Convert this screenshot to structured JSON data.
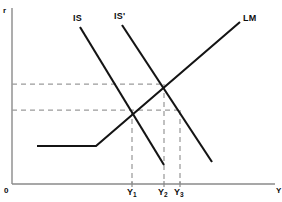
{
  "figure": {
    "kind": "is-lm-diagram",
    "width": 282,
    "height": 202,
    "background_color": "#ffffff"
  },
  "axes": {
    "y_axis_label": "r",
    "x_axis_label": "Y",
    "origin_label": "0",
    "axis_color": "#8a8a8a",
    "x_axis_y_px": 184,
    "y_axis_x_px": 12,
    "x_axis_end_px": 275,
    "y_axis_top_px": 8
  },
  "curves": [
    {
      "id": "is",
      "label": "IS",
      "color": "#141414",
      "label_x": 73,
      "label_y": 14,
      "points": [
        [
          80,
          27
        ],
        [
          164,
          165
        ]
      ]
    },
    {
      "id": "is-prime",
      "label": "IS'",
      "color": "#141414",
      "label_x": 114,
      "label_y": 12,
      "points": [
        [
          122,
          25
        ],
        [
          212,
          162
        ]
      ]
    },
    {
      "id": "lm",
      "label": "LM",
      "color": "#141414",
      "label_x": 243,
      "label_y": 14,
      "points": [
        [
          37,
          146
        ],
        [
          96,
          146
        ],
        [
          240,
          22
        ]
      ]
    }
  ],
  "guides": {
    "color": "#9b9b9b",
    "horizontal": [
      {
        "id": "r2-guide",
        "y": 84,
        "x_from": 12,
        "x_to": 164
      },
      {
        "id": "r1-guide",
        "y": 110,
        "x_from": 12,
        "x_to": 180
      }
    ],
    "vertical": [
      {
        "id": "y1-guide",
        "x": 132,
        "y_from": 110,
        "y_to": 184
      },
      {
        "id": "y2-guide",
        "x": 164,
        "y_from": 84,
        "y_to": 184
      },
      {
        "id": "y3-guide",
        "x": 180,
        "y_from": 110,
        "y_to": 184
      }
    ]
  },
  "equilibria": [
    {
      "id": "eq-1",
      "curves": "IS x LM",
      "x": 132,
      "y": 110
    },
    {
      "id": "eq-2",
      "curves": "IS' x LM",
      "x": 164,
      "y": 84
    },
    {
      "id": "eq-3",
      "curves": "IS' at r1",
      "x": 180,
      "y": 110
    }
  ],
  "x_ticks": [
    {
      "id": "y1",
      "base": "Y",
      "sub": "1",
      "x": 132,
      "label_x": 128,
      "label_y": 188
    },
    {
      "id": "y2",
      "base": "Y",
      "sub": "2",
      "x": 164,
      "label_x": 159,
      "label_y": 188
    },
    {
      "id": "y3",
      "base": "Y",
      "sub": "3",
      "x": 180,
      "label_x": 175,
      "label_y": 188
    }
  ],
  "chart_data": {
    "type": "line",
    "title": "",
    "xlabel": "Y",
    "ylabel": "r",
    "grid": false,
    "legend": "inline-curve-labels",
    "xlim": [
      0,
      282
    ],
    "ylim": [
      0,
      202
    ],
    "series": [
      {
        "name": "IS",
        "x": [
          80,
          164
        ],
        "y_pixels": [
          27,
          165
        ],
        "description": "downward-sloping goods-market schedule"
      },
      {
        "name": "IS'",
        "x": [
          122,
          212
        ],
        "y_pixels": [
          25,
          162
        ],
        "description": "rightward-shifted goods-market schedule"
      },
      {
        "name": "LM",
        "x": [
          37,
          96,
          240
        ],
        "y_pixels": [
          146,
          146,
          22
        ],
        "description": "money-market schedule with horizontal liquidity-trap segment then upward slope"
      }
    ],
    "annotations": [
      {
        "text": "IS",
        "x": 73,
        "y": 14
      },
      {
        "text": "IS'",
        "x": 114,
        "y": 12
      },
      {
        "text": "LM",
        "x": 243,
        "y": 14
      },
      {
        "text": "Y1",
        "x": 128,
        "y": 188
      },
      {
        "text": "Y2",
        "x": 159,
        "y": 188
      },
      {
        "text": "Y3",
        "x": 175,
        "y": 188
      },
      {
        "text": "r",
        "x": 4,
        "y": 7
      },
      {
        "text": "Y",
        "x": 276,
        "y": 188
      },
      {
        "text": "0",
        "x": 4,
        "y": 188
      }
    ]
  }
}
